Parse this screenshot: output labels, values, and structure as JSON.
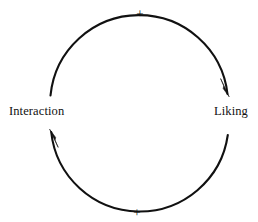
{
  "diagram": {
    "type": "causal-loop",
    "background_color": "#ffffff",
    "stroke_color": "#111111",
    "nodes": [
      {
        "id": "interaction",
        "label": "Interaction",
        "position": "left"
      },
      {
        "id": "liking",
        "label": "Liking",
        "position": "right"
      }
    ],
    "links": [
      {
        "id": "interaction-to-liking",
        "from": "Interaction",
        "to": "Liking",
        "path": "top-arc",
        "direction": "clockwise",
        "polarity": "+"
      },
      {
        "id": "liking-to-interaction",
        "from": "Liking",
        "to": "Interaction",
        "path": "bottom-arc",
        "direction": "counter-clockwise",
        "polarity": "+"
      }
    ],
    "polarity_labels": {
      "top": "+",
      "bottom": "+"
    },
    "geometry": {
      "center_x": 139,
      "center_y": 112,
      "radius": 89
    }
  }
}
